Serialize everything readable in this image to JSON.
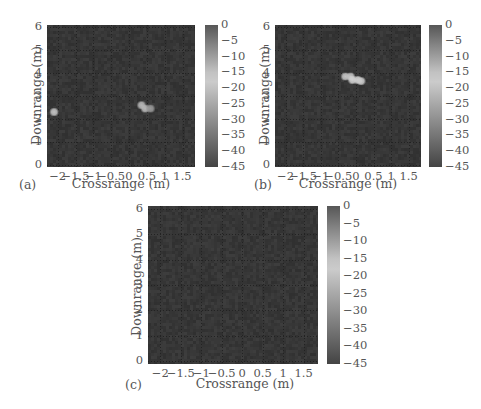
{
  "figure": {
    "panels": [
      {
        "label": "(a)",
        "xlabel": "Crossrange (m)",
        "ylabel": "Downrange (m)"
      },
      {
        "label": "(b)",
        "xlabel": "Crossrange (m)",
        "ylabel": "Downrange (m)"
      },
      {
        "label": "(c)",
        "xlabel": "Crossrange (m)",
        "ylabel": "Downrange (m)"
      }
    ],
    "xticks": [
      "-2",
      "-1.5",
      "-1",
      "-0.5",
      "0",
      "0.5",
      "1",
      "1.5"
    ],
    "yticks": [
      "6",
      "5",
      "4",
      "3",
      "2",
      "1",
      "0"
    ],
    "cbticks": [
      "0",
      "-5",
      "-10",
      "-15",
      "-20",
      "-25",
      "-30",
      "-35",
      "-40",
      "-45"
    ],
    "colors": {
      "plot_bg": "#3b3b3b",
      "grid": "#222222",
      "cbar_top": "#575757",
      "cbar_light": "#d0d0d0",
      "cbar_bottom": "#444444",
      "hotspot": "#cfcfcf"
    }
  },
  "chart_data": [
    {
      "type": "heatmap",
      "title": "(a)",
      "xlabel": "Crossrange (m)",
      "ylabel": "Downrange (m)",
      "xlim": [
        -2.3,
        1.85
      ],
      "ylim": [
        -0.1,
        6.1
      ],
      "xticks": [
        -2,
        -1.5,
        -1,
        -0.5,
        0,
        0.5,
        1,
        1.5
      ],
      "yticks": [
        0,
        1,
        2,
        3,
        4,
        5,
        6
      ],
      "colorbar": {
        "range_db": [
          -45,
          0
        ],
        "ticks": [
          0,
          -5,
          -10,
          -15,
          -20,
          -25,
          -30,
          -35,
          -40,
          -45
        ]
      },
      "grid": true,
      "background_db": -42,
      "hotspots": [
        {
          "x": -2.1,
          "y": 2.3,
          "level_db": -15
        },
        {
          "x": 0.35,
          "y": 2.6,
          "level_db": -22
        },
        {
          "x": 0.45,
          "y": 2.45,
          "level_db": -22
        },
        {
          "x": 0.6,
          "y": 2.45,
          "level_db": -28
        }
      ]
    },
    {
      "type": "heatmap",
      "title": "(b)",
      "xlabel": "Crossrange (m)",
      "ylabel": "Downrange (m)",
      "xlim": [
        -2.3,
        1.85
      ],
      "ylim": [
        -0.1,
        6.1
      ],
      "xticks": [
        -2,
        -1.5,
        -1,
        -0.5,
        0,
        0.5,
        1,
        1.5
      ],
      "yticks": [
        0,
        1,
        2,
        3,
        4,
        5,
        6
      ],
      "colorbar": {
        "range_db": [
          -45,
          0
        ],
        "ticks": [
          0,
          -5,
          -10,
          -15,
          -20,
          -25,
          -30,
          -35,
          -40,
          -45
        ]
      },
      "grid": true,
      "background_db": -42,
      "hotspots": [
        {
          "x": -0.3,
          "y": 3.85,
          "level_db": -15
        },
        {
          "x": -0.15,
          "y": 3.85,
          "level_db": -15
        },
        {
          "x": -0.1,
          "y": 3.7,
          "level_db": -17
        },
        {
          "x": 0.05,
          "y": 3.7,
          "level_db": -17
        },
        {
          "x": 0.15,
          "y": 3.65,
          "level_db": -18
        }
      ]
    },
    {
      "type": "heatmap",
      "title": "(c)",
      "xlabel": "Crossrange (m)",
      "ylabel": "Downrange (m)",
      "xlim": [
        -2.3,
        1.85
      ],
      "ylim": [
        -0.1,
        6.1
      ],
      "xticks": [
        -2,
        -1.5,
        -1,
        -0.5,
        0,
        0.5,
        1,
        1.5
      ],
      "yticks": [
        0,
        1,
        2,
        3,
        4,
        5,
        6
      ],
      "colorbar": {
        "range_db": [
          -45,
          0
        ],
        "ticks": [
          0,
          -5,
          -10,
          -15,
          -20,
          -25,
          -30,
          -35,
          -40,
          -45
        ]
      },
      "grid": true,
      "background_db": -42,
      "hotspots": []
    }
  ]
}
